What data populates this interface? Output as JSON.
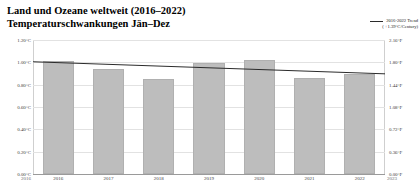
{
  "header": {
    "title_line1": "Land und Ozeane weltweit (2016–2022)",
    "title_line2": "Temperaturschwankungen Jän–Dez"
  },
  "legend": {
    "trend_label": "2016-2022 Trend",
    "trend_rate": "( +1.39°C/Century)",
    "trend_color": "#2b2b2b"
  },
  "axis": {
    "left_ticks": [
      "1.20°C",
      "1.00°C",
      "0.80°C",
      "0.60°C",
      "0.40°C",
      "0.20°C",
      "0.00°C"
    ],
    "right_ticks": [
      "2.16°F",
      "1.80°F",
      "1.44°F",
      "1.08°F",
      "0.72°F",
      "0.36°F",
      "0.00°F"
    ],
    "x_labels": [
      "2016",
      "2017",
      "2018",
      "2019",
      "2020",
      "2021",
      "2022"
    ],
    "x_edge_left": "2016",
    "x_edge_right": "2023"
  },
  "colors": {
    "bar_fill": "#bdbdbd",
    "bar_stroke": "#b0b0b0",
    "grid": "#e2e2e2",
    "baseline": "#9a9a9a",
    "text": "#3a3a3a"
  },
  "chart_data": {
    "type": "bar",
    "title": "Land und Ozeane weltweit (2016–2022) Temperaturschwankungen Jän–Dez",
    "xlabel": "",
    "ylabel": "°C",
    "ylabel_secondary": "°F",
    "categories": [
      "2016",
      "2017",
      "2018",
      "2019",
      "2020",
      "2021",
      "2022"
    ],
    "values": [
      1.01,
      0.94,
      0.85,
      0.99,
      1.02,
      0.86,
      0.9
    ],
    "ylim": [
      0.0,
      1.2
    ],
    "ylim_secondary": [
      0.0,
      2.16
    ],
    "ytick_values": [
      1.2,
      1.0,
      0.8,
      0.6,
      0.4,
      0.2,
      0.0
    ],
    "ytick_values_secondary": [
      2.16,
      1.8,
      1.44,
      1.08,
      0.72,
      0.36,
      0.0
    ],
    "grid": true,
    "legend_position": "top-right",
    "series": [
      {
        "name": "Temperaturanomalie",
        "type": "bar",
        "values": [
          1.01,
          0.94,
          0.85,
          0.99,
          1.02,
          0.86,
          0.9
        ]
      },
      {
        "name": "2016-2022 Trend",
        "type": "line",
        "rate": "+1.39°C/Century",
        "values": [
          1.005,
          0.987,
          0.969,
          0.951,
          0.933,
          0.915,
          0.897
        ]
      }
    ]
  }
}
